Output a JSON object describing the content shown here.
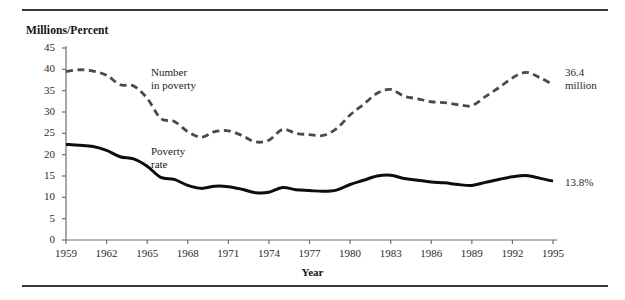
{
  "figure": {
    "y_axis_title": "Millions/Percent",
    "x_axis_title": "Year",
    "end_label_number": "36.4",
    "end_label_number_unit": "million",
    "end_label_rate": "13.8%",
    "annot_number_line1": "Number",
    "annot_number_line2": "in poverty",
    "annot_rate_line1": "Poverty",
    "annot_rate_line2": "rate",
    "colors": {
      "number_line": "#4a4a4a",
      "rate_line": "#0d0d0d",
      "axis": "#6f6f6f",
      "rule": "#3a3a3a",
      "text": "#2b2b2b"
    }
  },
  "chart_data": {
    "type": "line",
    "title": "",
    "subtitle": "",
    "xlabel": "Year",
    "ylabel": "Millions/Percent",
    "xlim": [
      1959,
      1995
    ],
    "ylim": [
      0,
      45
    ],
    "ytick_values": [
      0,
      5,
      10,
      15,
      20,
      25,
      30,
      35,
      40,
      45
    ],
    "ytick_labels": [
      "0",
      "5",
      "10",
      "15",
      "20",
      "25",
      "30",
      "35",
      "40",
      "45"
    ],
    "xtick_values": [
      1959,
      1962,
      1965,
      1968,
      1971,
      1974,
      1977,
      1980,
      1983,
      1986,
      1989,
      1992,
      1995
    ],
    "xtick_labels": [
      "1959",
      "1962",
      "1965",
      "1968",
      "1971",
      "1974",
      "1977",
      "1980",
      "1983",
      "1986",
      "1989",
      "1992",
      "1995"
    ],
    "grid": false,
    "legend": "inline-annotations",
    "x": [
      1959,
      1960,
      1961,
      1962,
      1963,
      1964,
      1965,
      1966,
      1967,
      1968,
      1969,
      1970,
      1971,
      1972,
      1973,
      1974,
      1975,
      1976,
      1977,
      1978,
      1979,
      1980,
      1981,
      1982,
      1983,
      1984,
      1985,
      1986,
      1987,
      1988,
      1989,
      1990,
      1991,
      1992,
      1993,
      1994,
      1995
    ],
    "series": [
      {
        "name": "Number in poverty",
        "units": "millions",
        "style": "dashed",
        "color": "#4a4a4a",
        "end_value": 36.4,
        "end_value_label": "36.4 million",
        "annotation": "Number in poverty",
        "values": [
          39.5,
          39.9,
          39.6,
          38.6,
          36.4,
          36.1,
          33.2,
          28.5,
          27.8,
          25.4,
          24.1,
          25.4,
          25.6,
          24.5,
          23.0,
          23.4,
          25.9,
          25.0,
          24.7,
          24.5,
          26.1,
          29.3,
          31.8,
          34.4,
          35.3,
          33.7,
          33.1,
          32.4,
          32.2,
          31.7,
          31.5,
          33.6,
          35.7,
          38.0,
          39.3,
          38.1,
          36.4
        ]
      },
      {
        "name": "Poverty rate",
        "units": "percent",
        "style": "solid",
        "color": "#0d0d0d",
        "end_value": 13.8,
        "end_value_label": "13.8%",
        "annotation": "Poverty rate",
        "values": [
          22.4,
          22.2,
          21.9,
          21.0,
          19.5,
          19.0,
          17.3,
          14.7,
          14.2,
          12.8,
          12.1,
          12.6,
          12.5,
          11.9,
          11.1,
          11.2,
          12.3,
          11.8,
          11.6,
          11.4,
          11.7,
          13.0,
          14.0,
          15.0,
          15.2,
          14.4,
          14.0,
          13.6,
          13.4,
          13.0,
          12.8,
          13.5,
          14.2,
          14.8,
          15.1,
          14.5,
          13.8
        ]
      }
    ]
  }
}
